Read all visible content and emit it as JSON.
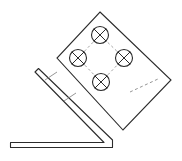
{
  "figure": {
    "type": "technical-line-drawing",
    "title": "",
    "background_color": "#ffffff",
    "line_color": "#2b2b2b",
    "hidden_line_color": "#8a8a8a",
    "fill_color": "#ffffff",
    "width": 182,
    "height": 161
  },
  "plate": {
    "name": "rotated-mounting-plate",
    "rotation_degrees": -45,
    "corners": [
      {
        "label": "top",
        "x": 100,
        "y": 12
      },
      {
        "label": "right",
        "x": 171,
        "y": 80
      },
      {
        "label": "bottom",
        "x": 123,
        "y": 130
      },
      {
        "label": "left",
        "x": 57,
        "y": 58
      }
    ],
    "outline_points": "100,12 171,80 123,130 57,58",
    "stroke_width": 1.1,
    "hidden_edge": {
      "name": "plate-hidden-edge",
      "from_x": 130,
      "from_y": 92,
      "to_x": 158,
      "to_y": 79,
      "dash": "3,2.5"
    }
  },
  "holes": [
    {
      "name": "hole-top",
      "cx": 100,
      "cy": 35,
      "r": 8.5
    },
    {
      "name": "hole-left",
      "cx": 78,
      "cy": 58,
      "r": 8.5
    },
    {
      "name": "hole-right",
      "cx": 124,
      "cy": 58,
      "r": 8.5
    },
    {
      "name": "hole-bottom",
      "cx": 101,
      "cy": 82,
      "r": 8.5
    }
  ],
  "hole_pattern": {
    "name": "bolt-circle-construction-lines",
    "count": 4,
    "arrangement": "diamond",
    "dash": "2.5,2.5",
    "segments": [
      {
        "x1": 100,
        "y1": 35,
        "x2": 78,
        "y2": 58
      },
      {
        "x1": 78,
        "y1": 58,
        "x2": 101,
        "y2": 82
      },
      {
        "x1": 101,
        "y1": 82,
        "x2": 124,
        "y2": 58
      },
      {
        "x1": 124,
        "y1": 58,
        "x2": 100,
        "y2": 35
      }
    ]
  },
  "bracket": {
    "name": "l-shaped-angle-bracket",
    "description": "hex-key style bent bar with diagonal arm and horizontal arm",
    "thickness": 4.5,
    "outer_path": "M 38.5,68.5 L 112.5,140.0 L 112.5,147.5 L 10.5,147.5 L 10.5,142.5 L 104.0,142.5 L 35.0,72.0 Z",
    "diagonal_arm": {
      "name": "bracket-diagonal-arm",
      "start_x": 38.5,
      "start_y": 68.5,
      "end_x": 110.0,
      "end_y": 140.0
    },
    "horizontal_arm": {
      "name": "bracket-horizontal-arm",
      "start_x": 10.5,
      "start_y": 145.0,
      "end_x": 112.0,
      "end_y": 145.0
    },
    "bend_corner": {
      "x": 110,
      "y": 143
    }
  },
  "tick_marks": [
    {
      "name": "tick-mark-upper",
      "x1": 45.0,
      "y1": 80.0,
      "x2": 57.0,
      "y2": 72.0
    },
    {
      "name": "tick-mark-lower",
      "x1": 64.0,
      "y1": 101.0,
      "x2": 76.0,
      "y2": 93.0
    }
  ]
}
